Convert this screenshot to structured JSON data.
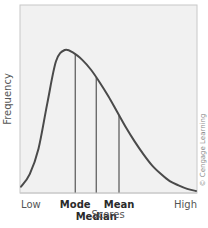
{
  "chart_data": {
    "type": "line",
    "title": "",
    "xlabel": "Scores",
    "ylabel": "Frequency",
    "x_tick_labels": {
      "low": "Low",
      "high": "High"
    },
    "xlim": [
      0,
      1
    ],
    "ylim": [
      0,
      1
    ],
    "grid": false,
    "legend": "none",
    "series": [
      {
        "name": "distribution",
        "x": [
          0.0,
          0.05,
          0.1,
          0.15,
          0.2,
          0.25,
          0.3,
          0.35,
          0.4,
          0.45,
          0.5,
          0.55,
          0.6,
          0.65,
          0.7,
          0.75,
          0.8,
          0.85,
          0.9,
          0.95,
          1.0
        ],
        "y": [
          0.03,
          0.12,
          0.3,
          0.62,
          0.92,
          1.0,
          0.98,
          0.93,
          0.86,
          0.77,
          0.67,
          0.56,
          0.45,
          0.35,
          0.26,
          0.18,
          0.12,
          0.07,
          0.04,
          0.015,
          0.0
        ]
      }
    ],
    "markers": [
      {
        "name": "mode",
        "label": "Mode",
        "x": 0.31,
        "row": 1
      },
      {
        "name": "median",
        "label": "Median",
        "x": 0.43,
        "row": 2
      },
      {
        "name": "mean",
        "label": "Mean",
        "x": 0.56,
        "row": 1
      }
    ],
    "annotations": [
      {
        "text": "© Cengage Learning",
        "placement": "right-vertical"
      }
    ],
    "colors": {
      "curve": "#4a4a4a",
      "marker_line": "#555555",
      "plot_background": "#f1f1f1",
      "frame": "#c8c8c8"
    }
  }
}
